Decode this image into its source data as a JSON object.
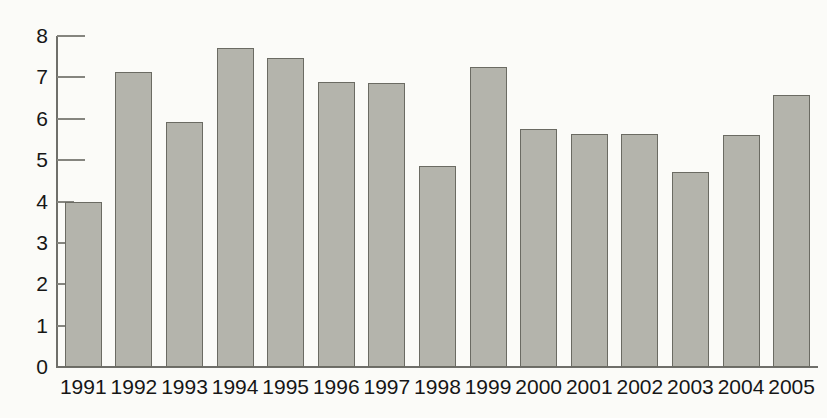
{
  "chart_data": {
    "type": "bar",
    "title": "",
    "subtitle": "",
    "xlabel": "",
    "ylabel": "",
    "categories": [
      "1991",
      "1992",
      "1993",
      "1994",
      "1995",
      "1996",
      "1997",
      "1998",
      "1999",
      "2000",
      "2001",
      "2002",
      "2003",
      "2004",
      "2005"
    ],
    "values": [
      4.0,
      7.13,
      5.92,
      7.72,
      7.48,
      6.88,
      6.87,
      4.86,
      7.25,
      5.75,
      5.63,
      5.62,
      4.71,
      5.6,
      6.58
    ],
    "series": [
      {
        "name": "",
        "values": [
          4.0,
          7.13,
          5.92,
          7.72,
          7.48,
          6.88,
          6.87,
          4.86,
          7.25,
          5.75,
          5.63,
          5.62,
          4.71,
          5.6,
          6.58
        ]
      }
    ],
    "ylim": [
      0,
      8
    ],
    "ytick_labels": [
      "0",
      "1",
      "2",
      "3",
      "4",
      "5",
      "6",
      "7",
      "8"
    ],
    "ytick_values": [
      0,
      1,
      2,
      3,
      4,
      5,
      6,
      7,
      8
    ],
    "grid": false,
    "legend": null,
    "legend_position": "none",
    "annotations": [],
    "colors": {
      "bar_fill": "#b4b4ac",
      "bar_stroke": "#6b6b63",
      "axis": "#6f6f6a",
      "text": "#161616",
      "background": "#fbfbf8"
    }
  }
}
